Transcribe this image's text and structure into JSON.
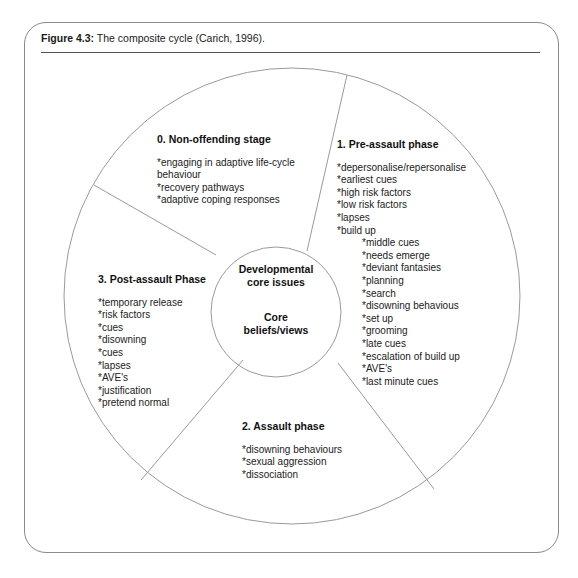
{
  "figure": {
    "label": "Figure 4.3:",
    "caption": " The composite cycle (Carich, 1996)."
  },
  "center": {
    "line1": "Developmental",
    "line2": "core issues",
    "line3": "Core",
    "line4": "beliefs/views"
  },
  "segments": {
    "stage0": {
      "title": "0. Non-offending stage",
      "items": [
        "*engaging in adaptive life-cycle",
        "behaviour",
        "*recovery pathways",
        "*adaptive coping responses"
      ]
    },
    "stage1": {
      "title": "1. Pre-assault phase",
      "items": [
        "*depersonalise/repersonalise",
        "*earliest cues",
        "*high risk factors",
        "*low risk factors",
        "*lapses",
        "*build up"
      ],
      "subitems": [
        "*middle cues",
        "*needs emerge",
        "*deviant fantasies",
        "*planning",
        "*search",
        "*disowning behavious",
        "*set up",
        "*grooming",
        "*late cues",
        "*escalation of build up",
        "*AVE's",
        "*last minute cues"
      ]
    },
    "stage2": {
      "title": "2. Assault phase",
      "items": [
        "*disowning behaviours",
        "*sexual aggression",
        "*dissociation"
      ]
    },
    "stage3": {
      "title": "3. Post-assault Phase",
      "items": [
        "*temporary release",
        "*risk factors",
        "*cues",
        "*disowning",
        "*cues",
        "*lapses",
        "*AVE's",
        "*justification",
        "*pretend normal"
      ]
    }
  }
}
